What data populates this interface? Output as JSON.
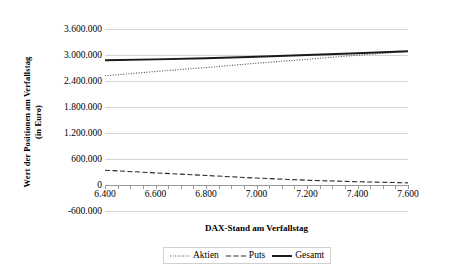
{
  "chart_data": {
    "type": "line",
    "title": "",
    "xlabel": "DAX-Stand am Verfallstag",
    "ylabel_line1": "Wert der Positionen am Verfallstag",
    "ylabel_line2": "(in Euro)",
    "xlim": [
      6400,
      7600
    ],
    "ylim": [
      -600000,
      3600000
    ],
    "grid": true,
    "legend_position": "bottom",
    "x_ticks": [
      "6.400",
      "6.600",
      "6.800",
      "7.000",
      "7.200",
      "7.400",
      "7.600"
    ],
    "x_tick_values": [
      6400,
      6600,
      6800,
      7000,
      7200,
      7400,
      7600
    ],
    "y_ticks": [
      "-600.000",
      "0",
      "600.000",
      "1.200.000",
      "1.800.000",
      "2.400.000",
      "3.000.000",
      "3.600.000"
    ],
    "y_tick_values": [
      -600000,
      0,
      600000,
      1200000,
      1800000,
      2400000,
      3000000,
      3600000
    ],
    "x": [
      6400,
      6600,
      6800,
      7000,
      7200,
      7400,
      7600
    ],
    "series": [
      {
        "name": "Aktien",
        "style": "dotted",
        "color": "#4a4a4a",
        "values": [
          2520000,
          2620000,
          2710000,
          2810000,
          2900000,
          2995000,
          3085000
        ]
      },
      {
        "name": "Puts",
        "style": "dashed",
        "color": "#2b2b2b",
        "values": [
          340000,
          280000,
          220000,
          160000,
          110000,
          75000,
          50000
        ]
      },
      {
        "name": "Gesamt",
        "style": "solid",
        "color": "#1a1a1a",
        "values": [
          2880000,
          2900000,
          2925000,
          2960000,
          3000000,
          3040000,
          3085000
        ]
      }
    ]
  },
  "legend": {
    "items": [
      {
        "label": "Aktien",
        "icon": "dotted-line-icon"
      },
      {
        "label": "Puts",
        "icon": "dashed-line-icon"
      },
      {
        "label": "Gesamt",
        "icon": "solid-line-icon"
      }
    ]
  }
}
